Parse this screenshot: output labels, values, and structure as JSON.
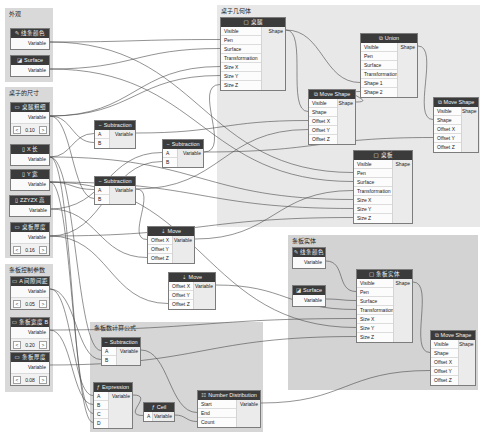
{
  "groups": {
    "appearance": {
      "title": "外观"
    },
    "table_dimensions": {
      "title": "桌子的尺寸"
    },
    "slat_params": {
      "title": "条板控制参数"
    },
    "table_geometry": {
      "title": "桌子几何体"
    },
    "slat_solid": {
      "title": "条板实体"
    },
    "slat_count_formula": {
      "title": "条板数计算公式"
    }
  },
  "nodes": {
    "line_color_1": {
      "title": "线条颜色",
      "icon": "brush-icon",
      "output": "Variable"
    },
    "surface_1": {
      "title": "Surface",
      "icon": "paint-bucket-icon",
      "output": "Variable"
    },
    "leg_thickness": {
      "title": "桌腿粗细",
      "icon": "slider-icon",
      "output": "Variable",
      "value": "0.10",
      "dec": "<",
      "inc": ">"
    },
    "x_length": {
      "title": "X 长",
      "icon": "ruler-icon",
      "output": "Variable"
    },
    "y_width": {
      "title": "Y 宽",
      "icon": "ruler-icon",
      "output": "Variable"
    },
    "z_height": {
      "title": "ZZYZX 高",
      "icon": "ruler-icon",
      "output": "Variable"
    },
    "board_thickness": {
      "title": "桌板厚度",
      "icon": "slider-icon",
      "output": "Variable",
      "value": "0.16",
      "dec": "<",
      "inc": ">"
    },
    "gap_spacing": {
      "title": "A 间隙间距",
      "icon": "slider-icon",
      "output": "Variable",
      "value": "0.05",
      "dec": "<",
      "inc": ">"
    },
    "slat_width": {
      "title": "条板宽度 B",
      "icon": "slider-icon",
      "output": "Variable",
      "value": "0.20",
      "dec": "<",
      "inc": ">"
    },
    "slat_thickness": {
      "title": "条板厚度",
      "icon": "slider-icon",
      "output": "Variable",
      "value": "0.08",
      "dec": "<",
      "inc": ">"
    },
    "subtraction_1": {
      "title": "Subtraction",
      "inputs": [
        "A",
        "B"
      ],
      "output": "Variable"
    },
    "subtraction_2": {
      "title": "Subtraction",
      "inputs": [
        "A",
        "B"
      ],
      "output": "Variable"
    },
    "subtraction_3": {
      "title": "Subtraction",
      "inputs": [
        "A",
        "B"
      ],
      "output": "Variable"
    },
    "move_1": {
      "title": "Move",
      "inputs": [
        "Offset X",
        "Offset Y",
        "Offset Z"
      ],
      "output": "Variable"
    },
    "move_2": {
      "title": "Move",
      "inputs": [
        "Offset X",
        "Offset Y",
        "Offset Z"
      ],
      "output": "Variable"
    },
    "table_leg": {
      "title": "桌腿",
      "inputs": [
        "Visible",
        "Pen",
        "Surface",
        "Transformation",
        "Size X",
        "Size Y",
        "Size Z"
      ],
      "output": "Shape"
    },
    "union": {
      "title": "Union",
      "inputs": [
        "Visible",
        "Pen",
        "Surface",
        "Transformation",
        "Shape 1",
        "Shape 2"
      ],
      "output": "Shape"
    },
    "move_shape_1": {
      "title": "Move Shape",
      "inputs": [
        "Visible",
        "Shape",
        "Offset X",
        "Offset Y",
        "Offset Z"
      ],
      "output": "Shape"
    },
    "move_shape_2": {
      "title": "Move Shape",
      "inputs": [
        "Visible",
        "Shape",
        "Offset X",
        "Offset Y",
        "Offset Z"
      ],
      "output": "Shape"
    },
    "table_board": {
      "title": "桌板",
      "inputs": [
        "Visible",
        "Pen",
        "Surface",
        "Transformation",
        "Size X",
        "Size Y",
        "Size Z"
      ],
      "output": "Shape"
    },
    "line_color_2": {
      "title": "线条颜色",
      "icon": "brush-icon",
      "output": "Variable"
    },
    "surface_2": {
      "title": "Surface",
      "icon": "paint-bucket-icon",
      "output": "Variable"
    },
    "slat_solid": {
      "title": "条板实体",
      "inputs": [
        "Visible",
        "Pen",
        "Surface",
        "Transformation",
        "Size X",
        "Size Y",
        "Size Z"
      ],
      "output": "Shape"
    },
    "move_shape_3": {
      "title": "Move Shape",
      "inputs": [
        "Visible",
        "Shape",
        "Offset X",
        "Offset Y",
        "Offset Z"
      ],
      "output": "Shape"
    },
    "subtraction_4": {
      "title": "Subtraction",
      "inputs": [
        "A",
        "B"
      ],
      "output": "Variable"
    },
    "expression": {
      "title": "Expression",
      "inputs": [
        "A",
        "B",
        "C",
        "D"
      ],
      "output": "Variable"
    },
    "ceil": {
      "title": "Ceil",
      "inputs": [
        "A"
      ],
      "output": "Variable"
    },
    "number_distribution": {
      "title": "Number Distribution",
      "inputs": [
        "Start",
        "End",
        "Count"
      ],
      "output": "Variable"
    }
  },
  "colors": {
    "node_header": "#3b3b3b",
    "group_light": "#e8e8e8",
    "group_dark": "#d6d6d6",
    "wire": "#4a4a4a"
  }
}
